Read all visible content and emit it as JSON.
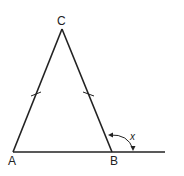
{
  "diagram": {
    "type": "geometry",
    "points": {
      "A": {
        "label": "A",
        "x": 13,
        "y": 152
      },
      "B": {
        "label": "B",
        "x": 112,
        "y": 152
      },
      "C": {
        "label": "C",
        "x": 62,
        "y": 29
      }
    },
    "segments": [
      "AC",
      "BC",
      "AB (extended past B)"
    ],
    "equal_sides": [
      "AC",
      "BC"
    ],
    "angle_label": "x",
    "colors": {
      "stroke": "#222222",
      "background": "#ffffff"
    }
  }
}
